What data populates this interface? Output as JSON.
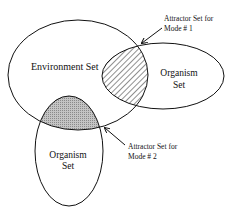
{
  "diagram": {
    "type": "venn",
    "sets": [
      {
        "id": "environment",
        "label": "Environment Set"
      },
      {
        "id": "organism1",
        "label_line1": "Organism",
        "label_line2": "Set"
      },
      {
        "id": "organism2",
        "label_line1": "Organism",
        "label_line2": "Set"
      }
    ],
    "annotations": [
      {
        "id": "mode1",
        "line1": "Attractor Set for",
        "line2": "Mode # 1",
        "fill": "hatched"
      },
      {
        "id": "mode2",
        "line1": "Attractor Set for",
        "line2": "Mode # 2",
        "fill": "gray"
      }
    ],
    "colors": {
      "stroke": "#111111",
      "shade": "#b8b8b8",
      "background": "#ffffff"
    }
  }
}
